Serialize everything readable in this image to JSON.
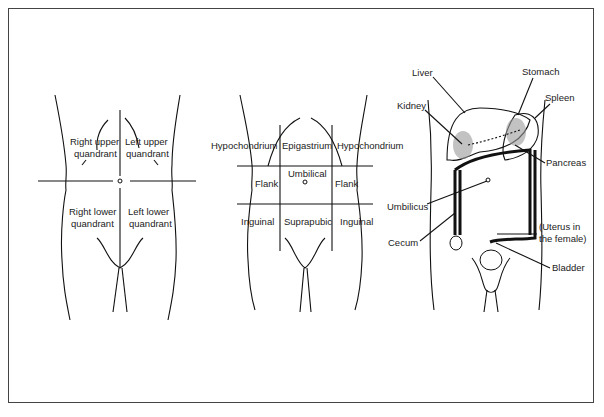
{
  "panels": [
    {
      "id": "quadrants",
      "title": "Abdominal quadrants",
      "labels": [
        "Right upper",
        "quandrant",
        "Left upper",
        "quandrant",
        "Right lower",
        "quandrant",
        "Left lower",
        "quandrant"
      ]
    },
    {
      "id": "regions",
      "title": "Abdominal regions",
      "labels": [
        "Hypochondrium",
        "Epigastrium",
        "Hypochondrium",
        "Flank",
        "Umbilical",
        "Flank",
        "Inguinal",
        "Suprapubic",
        "Inguinal"
      ]
    },
    {
      "id": "organs",
      "title": "Abdominal organs",
      "labels": [
        "Liver",
        "Stomach",
        "Spleen",
        "Kidney",
        "Pancreas",
        "Umbilicus",
        "(Uterus in",
        "the female)",
        "Cecum",
        "Bladder"
      ]
    }
  ]
}
